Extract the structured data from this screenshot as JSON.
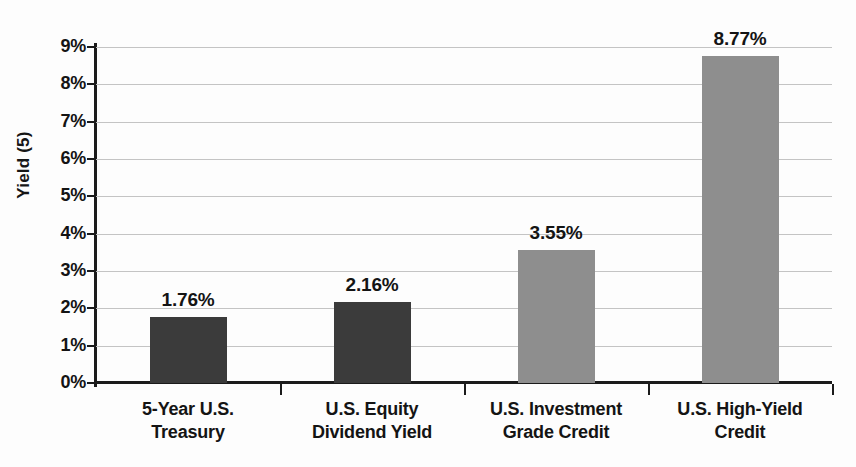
{
  "chart_data": {
    "type": "bar",
    "title": "",
    "xlabel": "",
    "ylabel": "Yield (5)",
    "categories": [
      "5-Year U.S. Treasury",
      "U.S. Equity Dividend Yield",
      "U.S. Investment Grade Credit",
      "U.S. High-Yield Credit"
    ],
    "category_lines": [
      [
        "5-Year U.S.",
        "Treasury"
      ],
      [
        "U.S. Equity",
        "Dividend Yield"
      ],
      [
        "U.S. Investment",
        "Grade Credit"
      ],
      [
        "U.S. High-Yield",
        "Credit"
      ]
    ],
    "values": [
      1.76,
      2.16,
      3.55,
      8.77
    ],
    "value_labels": [
      "1.76%",
      "2.16%",
      "3.55%",
      "8.77%"
    ],
    "bar_colors": [
      "#3b3b3b",
      "#3b3b3b",
      "#8e8e8e",
      "#8e8e8e"
    ],
    "ylim": [
      0,
      9
    ],
    "ytick_values": [
      0,
      1,
      2,
      3,
      4,
      5,
      6,
      7,
      8,
      9
    ],
    "ytick_labels": [
      "0%",
      "1%",
      "2%",
      "3%",
      "4%",
      "5%",
      "6%",
      "7%",
      "8%",
      "9%"
    ],
    "grid": true,
    "grid_axis": "y",
    "legend": false,
    "legend_position": "none",
    "background_color": "#fdfdfd",
    "axis_color": "#1b1b1b",
    "gridline_color": "#c4c4c4",
    "text_color": "#141414"
  }
}
